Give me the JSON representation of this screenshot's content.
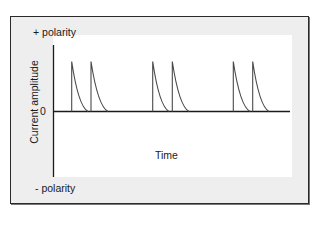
{
  "chart_data": {
    "type": "line",
    "title": "",
    "xlabel": "Time",
    "ylabel": "Current amplitude",
    "annotations": {
      "top": "+ polarity",
      "bottom": "- polarity",
      "zero_tick": "0"
    },
    "pulse_pairs": 3,
    "spikes": [
      {
        "x_start": 71.7,
        "peak_amplitude": 1.0,
        "decay_end": 88
      },
      {
        "x_start": 91,
        "peak_amplitude": 1.0,
        "decay_end": 108
      },
      {
        "x_start": 152.7,
        "peak_amplitude": 1.0,
        "decay_end": 169
      },
      {
        "x_start": 172.3,
        "peak_amplitude": 1.0,
        "decay_end": 189
      },
      {
        "x_start": 233.3,
        "peak_amplitude": 1.0,
        "decay_end": 250
      },
      {
        "x_start": 252.7,
        "peak_amplitude": 1.0,
        "decay_end": 269
      }
    ],
    "grid": false,
    "legend": "none",
    "colors": {
      "line": "#4a4a4a",
      "axis": "#1a1a1a",
      "frame_bg": "#eeeeee",
      "plot_bg": "#ffffff"
    }
  },
  "labels": {
    "positive_polarity": "+ polarity",
    "negative_polarity": "- polarity",
    "zero": "0",
    "y_axis": "Current amplitude",
    "x_axis": "Time"
  }
}
